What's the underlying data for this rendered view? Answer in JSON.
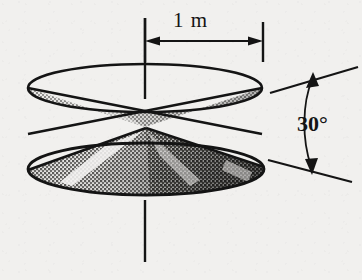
{
  "figure": {
    "background_color": "#f1f0ee",
    "ink_color": "#141414",
    "dimension": {
      "label": "1 m",
      "meaning": "radius of cone base",
      "arrow_style": "double-headed",
      "from_x": 145,
      "to_x": 263,
      "y": 41
    },
    "angle": {
      "label": "30°",
      "meaning": "half-angle between upper and lower slant lines",
      "value": 30,
      "unit": "degrees",
      "arc_arrow_style": "double-headed"
    },
    "axis": {
      "name": "axis-of-rotation",
      "x": 145,
      "top_y": 18,
      "bottom_y": 262,
      "style": "solid vertical line"
    },
    "cones": {
      "apex_x": 145,
      "apex_y": 127,
      "upper": {
        "name": "upper-cone",
        "orientation": "apex-down",
        "rim_center_x": 145,
        "rim_center_y": 88,
        "rim_rx": 117,
        "rim_ry": 24,
        "fill": "light halftone"
      },
      "lower": {
        "name": "lower-cone",
        "orientation": "apex-up",
        "base_center_x": 146,
        "base_center_y": 169,
        "base_rx": 118,
        "base_ry": 26,
        "fill": "dark halftone with highlight streaks"
      }
    },
    "tangent_lines": {
      "upper": {
        "name": "upper-tangent-line",
        "x1": 270,
        "y1": 93,
        "x2": 358,
        "y2": 67
      },
      "lower": {
        "name": "lower-tangent-line",
        "x1": 268,
        "y1": 160,
        "x2": 352,
        "y2": 182
      }
    }
  }
}
